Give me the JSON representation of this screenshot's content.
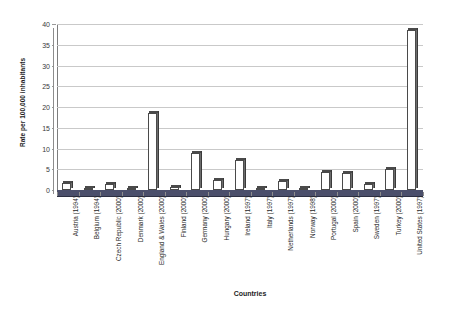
{
  "chart_data": {
    "type": "bar",
    "title": "",
    "subtitle": "",
    "xlabel": "Countries",
    "ylabel": "Rate per 100,000 inhabitants",
    "ylim": [
      0,
      40
    ],
    "y_ticks": [
      0,
      5,
      10,
      15,
      20,
      25,
      30,
      35,
      40
    ],
    "grid": true,
    "legend": "none",
    "categories": [
      "Austria (1994)",
      "Belgium (1994)",
      "Czech Republic (2000)",
      "Denmark (2000)",
      "England & Wales (2000)",
      "Finland (2000)",
      "Germany (2000)",
      "Hungary (2000)",
      "Ireland (1997)",
      "Italy (1997)",
      "Netherlands (1997)",
      "Norway (1998)",
      "Portugal (2000)",
      "Spain (2000)",
      "Sweden (1997)",
      "Turkey (2000)",
      "United States (1997)"
    ],
    "values": [
      1.8,
      0.6,
      1.5,
      0.5,
      18.5,
      0.8,
      9.0,
      2.5,
      7.2,
      0.4,
      2.2,
      0.5,
      4.3,
      4.2,
      1.4,
      5.0,
      38.5
    ],
    "series": [
      {
        "name": "Rate per 100,000 inhabitants",
        "values": [
          1.8,
          0.6,
          1.5,
          0.5,
          18.5,
          0.8,
          9.0,
          2.5,
          7.2,
          0.4,
          2.2,
          0.5,
          4.3,
          4.2,
          1.4,
          5.0,
          38.5
        ]
      }
    ],
    "colors": {
      "bar_face": "#ffffff",
      "bar_outline": "#4a4a4a",
      "bar_side": "#6d6d6d",
      "gridline": "#c9c9c9",
      "floor": "#4b4f6b",
      "background": "#ffffff",
      "text": "#1f1f1f"
    }
  }
}
